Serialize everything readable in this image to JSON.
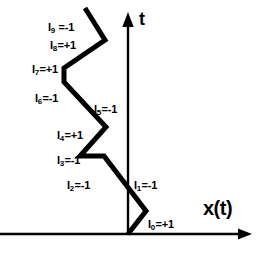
{
  "figure": {
    "type": "random-walk-zigzag-diagram",
    "background_color": "#ffffff",
    "stroke_color": "#000000"
  },
  "axes": {
    "vertical": {
      "name": "t-axis",
      "label": "t",
      "label_x": 139,
      "label_y": 10,
      "x": 128,
      "y_top": 18,
      "y_bottom": 236
    },
    "horizontal": {
      "name": "x-axis",
      "label": "x(t)",
      "label_x": 203,
      "label_y": 198,
      "y": 234,
      "x_left": 0,
      "x_right": 252
    }
  },
  "segments": [
    {
      "id": "I0",
      "symbol": "I",
      "subscript": "0",
      "equals": "=+1",
      "value": "+1",
      "text": "I0=+1",
      "label_x": 148,
      "label_y": 219
    },
    {
      "id": "I1",
      "symbol": "I",
      "subscript": "1",
      "equals": "=-1",
      "value": "-1",
      "text": "I1=-1",
      "label_x": 134,
      "label_y": 180
    },
    {
      "id": "I2",
      "symbol": "I",
      "subscript": "2",
      "equals": "=-1",
      "value": "-1",
      "text": "I2=-1",
      "label_x": 67,
      "label_y": 180
    },
    {
      "id": "I3",
      "symbol": "I",
      "subscript": "3",
      "equals": "=-1",
      "value": "-1",
      "text": "I3=-1",
      "label_x": 57,
      "label_y": 155
    },
    {
      "id": "I4",
      "symbol": "I",
      "subscript": "4",
      "equals": "=+1",
      "value": "+1",
      "text": "I4=+1",
      "label_x": 57,
      "label_y": 130
    },
    {
      "id": "I5",
      "symbol": "I",
      "subscript": "5",
      "equals": "=-1",
      "value": "-1",
      "text": "I5=-1",
      "label_x": 94,
      "label_y": 104
    },
    {
      "id": "I6",
      "symbol": "I",
      "subscript": "6",
      "equals": "=-1",
      "value": "-1",
      "text": "I6=-1",
      "label_x": 35,
      "label_y": 93
    },
    {
      "id": "I7",
      "symbol": "I",
      "subscript": "7",
      "equals": "=+1",
      "value": "+1",
      "text": "I7=+1",
      "label_x": 32,
      "label_y": 64
    },
    {
      "id": "I8",
      "symbol": "I",
      "subscript": "8",
      "equals": "=+1",
      "value": "+1",
      "text": "I8=+1",
      "label_x": 50,
      "label_y": 40
    },
    {
      "id": "I9",
      "symbol": "I",
      "subscript": "9",
      "equals": " =-1",
      "value": "-1",
      "text": "I9 =-1",
      "label_x": 48,
      "label_y": 22
    }
  ],
  "path": {
    "name": "zigzag-walk-path",
    "stroke_width": 5,
    "points": [
      {
        "x": 128,
        "y": 234
      },
      {
        "x": 146,
        "y": 211
      },
      {
        "x": 104,
        "y": 156
      },
      {
        "x": 80,
        "y": 156
      },
      {
        "x": 106,
        "y": 127
      },
      {
        "x": 64,
        "y": 82
      },
      {
        "x": 64,
        "y": 68
      },
      {
        "x": 105,
        "y": 40
      },
      {
        "x": 85,
        "y": 8
      }
    ]
  }
}
